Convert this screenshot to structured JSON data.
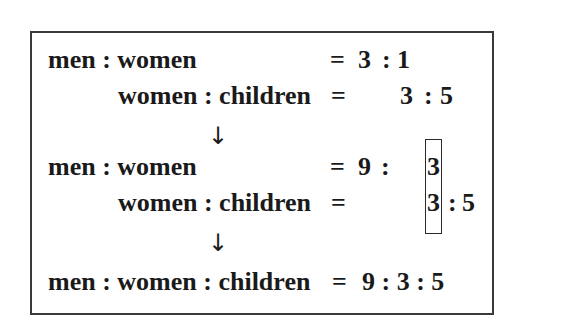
{
  "diagram": {
    "step1": {
      "row1": {
        "label": "men : women",
        "eq": "=",
        "a": "3",
        "sep": ":",
        "b": "1"
      },
      "row2": {
        "label": "women : children",
        "eq": "=",
        "a": "3",
        "sep": ":",
        "b": "5"
      }
    },
    "arrow1": "↓",
    "step2": {
      "row1": {
        "label": "men : women",
        "eq": "=",
        "a": "9",
        "sep": ":",
        "b": "3"
      },
      "row2": {
        "label": "women : children",
        "eq": "=",
        "a": "3",
        "sep": ":",
        "b": "5"
      },
      "highlight_note": "matching women term boxed"
    },
    "arrow2": "↓",
    "result": {
      "label": "men : women : children",
      "eq": "=",
      "value": "9 : 3 : 5"
    }
  }
}
